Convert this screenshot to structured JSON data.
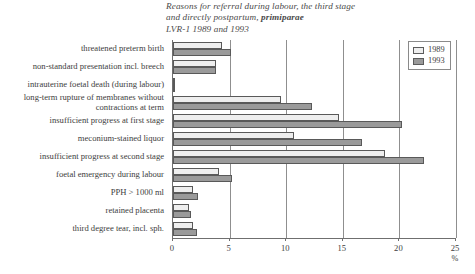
{
  "title": {
    "line1": "Reasons for referral during labour, the third stage",
    "line2_prefix": "and directly postpartum, ",
    "line2_emphasis": "primiparae",
    "line3": "LVR-1 1989 and 1993"
  },
  "legend": {
    "position": "top-right",
    "entries": [
      {
        "label": "1989",
        "color": "#eeeeee"
      },
      {
        "label": "1993",
        "color": "#9a9a9a"
      }
    ]
  },
  "axis": {
    "unit": "%",
    "ticks": [
      "0",
      "5",
      "10",
      "15",
      "20",
      "25"
    ]
  },
  "chart_data": {
    "type": "bar",
    "orientation": "horizontal",
    "title": "Reasons for referral during labour, the third stage and directly postpartum, primiparae LVR-1 1989 and 1993",
    "xlabel": "%",
    "ylabel": "",
    "xlim": [
      0,
      25
    ],
    "grid": true,
    "legend_position": "top-right",
    "categories": [
      "threatened preterm birth",
      "non-standard presentation incl. breech",
      "intrauterine foetal death (during labour)",
      "long-term rupture of membranes without contractions at term",
      "insufficient progress at first stage",
      "meconium-stained liquor",
      "insufficient progress at second stage",
      "foetal emergency during labour",
      "PPH > 1000 ml",
      "retained placenta",
      "third degree tear, incl. sph."
    ],
    "series": [
      {
        "name": "1989",
        "color": "#eeeeee",
        "values": [
          4.3,
          3.8,
          0.15,
          9.5,
          14.7,
          10.7,
          18.7,
          4.1,
          1.8,
          1.4,
          1.8
        ]
      },
      {
        "name": "1993",
        "color": "#9a9a9a",
        "values": [
          5.1,
          3.8,
          0.15,
          12.3,
          20.2,
          16.7,
          22.2,
          5.2,
          2.2,
          1.6,
          2.1
        ]
      }
    ]
  }
}
